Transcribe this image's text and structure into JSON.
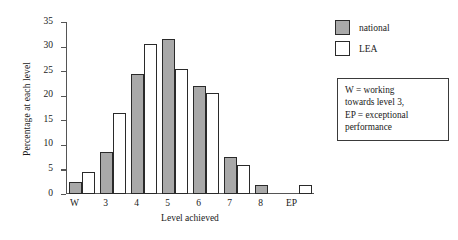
{
  "chart_data": {
    "type": "bar",
    "title": "",
    "xlabel": "Level achieved",
    "ylabel": "Percentage at each level",
    "categories": [
      "W",
      "3",
      "4",
      "5",
      "6",
      "7",
      "8",
      "EP"
    ],
    "series": [
      {
        "name": "national",
        "color": "#a9a9a9",
        "values": [
          2.5,
          8.5,
          24.5,
          31.5,
          22.0,
          7.5,
          1.8,
          0
        ]
      },
      {
        "name": "LEA",
        "color": "#ffffff",
        "values": [
          4.5,
          16.5,
          30.5,
          25.5,
          20.5,
          6.0,
          0,
          1.8
        ]
      }
    ],
    "ylim": [
      0,
      35
    ],
    "yticks": [
      0,
      5,
      10,
      15,
      20,
      25,
      30,
      35
    ],
    "ytick_labels": [
      "0",
      "5",
      "10",
      "15",
      "20",
      "25",
      "30",
      "35"
    ],
    "grid": false,
    "legend_position": "top-right"
  },
  "legend": {
    "items": [
      {
        "label": "national",
        "swatch": "national"
      },
      {
        "label": "LEA",
        "swatch": "lea"
      }
    ]
  },
  "note": {
    "lines": [
      "W = working",
      "towards level 3,",
      "EP = exceptional",
      "performance"
    ]
  }
}
